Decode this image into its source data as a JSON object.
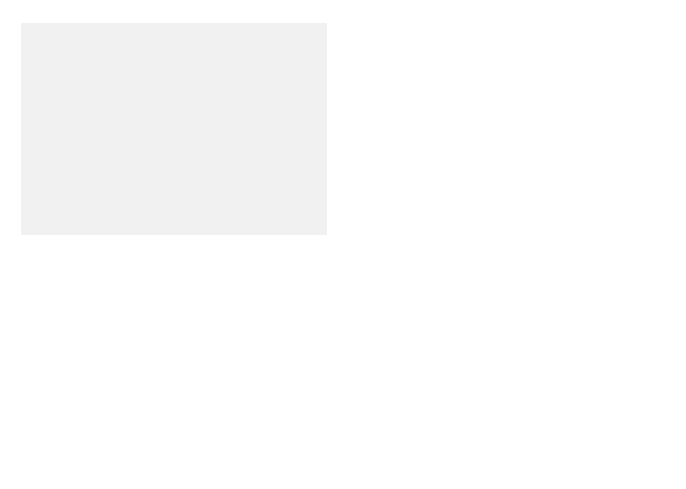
{
  "figure": {
    "panel_color": "#f1f1f1",
    "membrane_color": "#dcdcdc",
    "protein_color": "#9a9a9a"
  },
  "labels": {
    "tyrosine_kinase_receptor": [
      "Tyrosine kinase",
      "receptor"
    ],
    "plc_gamma": "PLCγ",
    "insp3_top": {
      "base": "InsP",
      "sub": "3"
    },
    "insp3_left": {
      "base": "InsP",
      "sub": "3"
    },
    "insp3_receptor_channel": {
      "line1_base": "InsP",
      "line1_sub": "3",
      "line1_rest": " receptor",
      "line2": "channel"
    },
    "ca_insp3": {
      "base": "Ca",
      "sup": "2+"
    },
    "calcium_in_er": "Calcium in ER",
    "plc_beta": {
      "base": "PLC",
      "sub": "β"
    },
    "g_protein": "G protein",
    "g_protein_linked_receptor": [
      "G protein-linked",
      "receptor"
    ],
    "calcium_channel": [
      "Calcium",
      "channel"
    ],
    "ca_channel": {
      "base": "Ca",
      "sup": "2+"
    },
    "calcium_pump_er": [
      "Calcium pump",
      "in ER membrane"
    ],
    "adp_er": "ADP",
    "ca_er_pump": {
      "base": "Ca",
      "sup": "2+"
    },
    "atp_er": "ATP",
    "atp_pm": "ATP",
    "ca_pm_pump": {
      "base": "Ca",
      "sup": "2+"
    },
    "adp_pm": "ADP",
    "calcium_pump_pm": [
      "Calcium pump",
      "in plasma membrane"
    ],
    "ca_ryanodine": {
      "base": "Ca",
      "sup": "2+"
    },
    "ryanodine_receptor_channel": [
      "Ryanodine",
      "receptor",
      "channel"
    ],
    "ca_mito": {
      "base": "Ca",
      "sup": "2+"
    },
    "mitochondrion": "Mitochondrion",
    "sodium_calcium_pump": [
      "Sodium-calcium",
      "pump"
    ],
    "na_exchanger": {
      "base": "Na",
      "sup": "+"
    },
    "ca_exchanger": {
      "base": "Ca",
      "sup": "2+"
    }
  }
}
